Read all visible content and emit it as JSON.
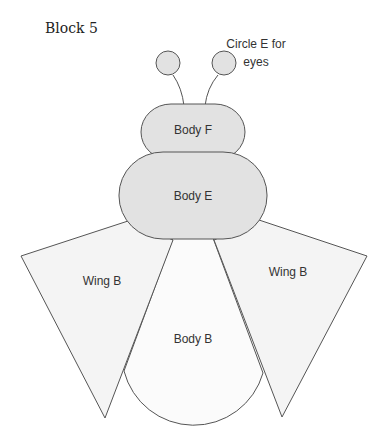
{
  "title": "Block 5",
  "labels": {
    "eyes_line1": "Circle E for",
    "eyes_line2": "eyes",
    "body_f": "Body F",
    "body_e": "Body E",
    "body_b": "Body B",
    "wing_left": "Wing B",
    "wing_right": "Wing B"
  },
  "colors": {
    "shaded_fill": "#e2e2e2",
    "light_fill": "#f4f4f4",
    "stroke": "#555555"
  }
}
